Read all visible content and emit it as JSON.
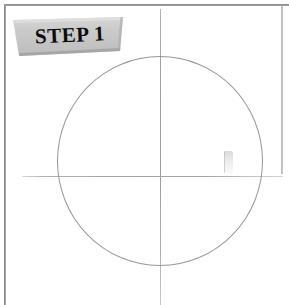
{
  "page": {
    "title": "Step 1",
    "background_color": "#ffffff",
    "width": 289,
    "height": 305
  },
  "frame": {
    "color": "#8d8d8d",
    "top_label": "frame-top-rule",
    "left_label": "frame-left-rule",
    "right_label": "frame-right-rule"
  },
  "banner": {
    "text": "STEP 1",
    "fill_color": "#c9c9c9",
    "highlight_color": "#d9d9d9",
    "shadow_color": "#9d9d9d",
    "text_color": "#0d0d0d"
  },
  "drawing": {
    "circle": {
      "name": "construction-circle",
      "stroke_color": "#8e8e8e",
      "center_x": 160,
      "center_y": 161,
      "radius_x": 103,
      "radius_y": 105
    },
    "axis_vertical": {
      "name": "vertical-guide-axis",
      "stroke_color": "#a3a3a3",
      "x": 160,
      "y_start": 9,
      "y_end": 305
    },
    "axis_horizontal": {
      "name": "horizontal-guide-axis",
      "stroke_color": "#a8a8a8",
      "y": 176,
      "x_start": 22,
      "x_end": 283
    },
    "smudge": {
      "name": "pencil-smudge-artifact",
      "x": 224,
      "y": 151
    }
  }
}
